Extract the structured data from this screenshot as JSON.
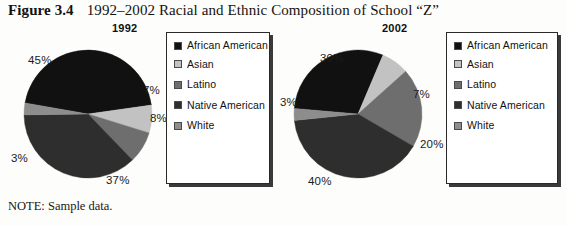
{
  "figure": {
    "label": "Figure 3.4",
    "title": "1992–2002 Racial and Ethnic Composition of School “Z”",
    "note": "NOTE: Sample data."
  },
  "legend_colors": {
    "african_american": "#111111",
    "asian": "#c2c2c2",
    "latino": "#6e6e6e",
    "native_american": "#2e2e2e",
    "white": "#8d8d8d"
  },
  "legend": {
    "items": [
      {
        "label": "African American",
        "color": "#111111",
        "swatch_name": "swatch-african-american"
      },
      {
        "label": "Asian",
        "color": "#c2c2c2",
        "swatch_name": "swatch-asian"
      },
      {
        "label": "Latino",
        "color": "#6e6e6e",
        "swatch_name": "swatch-latino"
      },
      {
        "label": "Native American",
        "color": "#2e2e2e",
        "swatch_name": "swatch-native-american"
      },
      {
        "label": "White",
        "color": "#8d8d8d",
        "swatch_name": "swatch-white"
      }
    ]
  },
  "panels": [
    {
      "year": "1992",
      "pct_labels": [
        "45%",
        "7%",
        "8%",
        "37%",
        "3%"
      ]
    },
    {
      "year": "2002",
      "pct_labels": [
        "30%",
        "7%",
        "20%",
        "40%",
        "3%"
      ]
    }
  ],
  "chart_data": [
    {
      "type": "pie",
      "title": "1992",
      "categories": [
        "African American",
        "Asian",
        "Latino",
        "White",
        "Native American"
      ],
      "values": [
        45,
        7,
        8,
        37,
        3
      ],
      "labels": [
        "45%",
        "7%",
        "8%",
        "37%",
        "3%"
      ],
      "colors": [
        "#111111",
        "#c2c2c2",
        "#6e6e6e",
        "#2e2e2e",
        "#8d8d8d"
      ],
      "legend_position": "right",
      "grid": false
    },
    {
      "type": "pie",
      "title": "2002",
      "categories": [
        "African American",
        "Asian",
        "Latino",
        "White",
        "Native American"
      ],
      "values": [
        30,
        7,
        20,
        40,
        3
      ],
      "labels": [
        "30%",
        "7%",
        "20%",
        "40%",
        "3%"
      ],
      "colors": [
        "#111111",
        "#c2c2c2",
        "#6e6e6e",
        "#2e2e2e",
        "#8d8d8d"
      ],
      "legend_position": "right",
      "grid": false
    }
  ]
}
